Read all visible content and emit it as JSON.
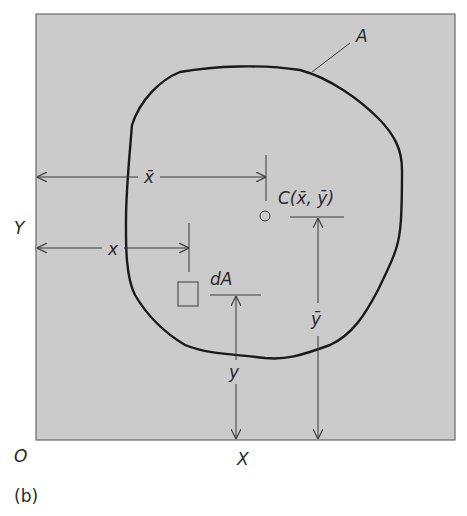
{
  "figure": {
    "caption": "(b)",
    "colors": {
      "background": "#ffffff",
      "panel": "#cbcbcb",
      "panel_border": "#6a6a6a",
      "outline": "#1a1a1a",
      "dimension_lines": "#3a3a3a"
    }
  },
  "labels": {
    "area": "A",
    "centroid": "C(x̄, ȳ)",
    "element": "dA",
    "x_bar": "x̄",
    "y_bar": "ȳ",
    "x": "x",
    "y": "y",
    "origin": "O",
    "axis_x": "X",
    "axis_y": "Y"
  }
}
